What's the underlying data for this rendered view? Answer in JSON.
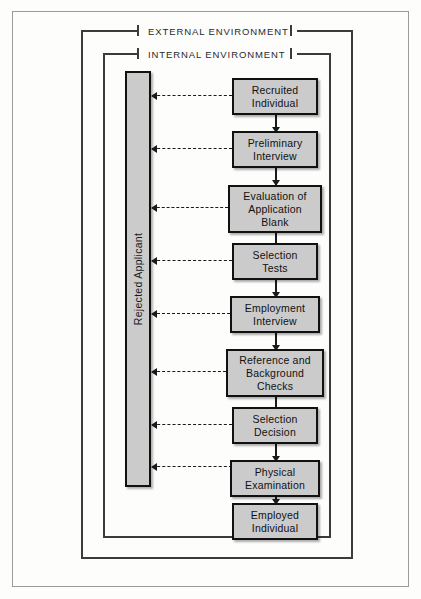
{
  "diagram": {
    "colors": {
      "box_fill": "#cbcbcb",
      "box_border": "#111111",
      "frame_line": "#3b3b3b",
      "page_border": "#9a9a9a",
      "background": "#fdfdfc"
    },
    "environments": [
      {
        "id": "external",
        "label": "EXTERNAL ENVIRONMENT"
      },
      {
        "id": "internal",
        "label": "INTERNAL ENVIRONMENT"
      }
    ],
    "reject_bar": {
      "label": "Rejected Applicant",
      "orientation": "vertical-bottom-to-top"
    },
    "steps": [
      {
        "id": "recruited-individual",
        "lines": [
          "Recruited",
          "Individual"
        ],
        "rejects": true
      },
      {
        "id": "preliminary-interview",
        "lines": [
          "Preliminary",
          "Interview"
        ],
        "rejects": true
      },
      {
        "id": "evaluation-of-application-blank",
        "lines": [
          "Evaluation of",
          "Application",
          "Blank"
        ],
        "rejects": true
      },
      {
        "id": "selection-tests",
        "lines": [
          "Selection",
          "Tests"
        ],
        "rejects": true
      },
      {
        "id": "employment-interview",
        "lines": [
          "Employment",
          "Interview"
        ],
        "rejects": true
      },
      {
        "id": "reference-and-background-checks",
        "lines": [
          "Reference and",
          "Background",
          "Checks"
        ],
        "rejects": true
      },
      {
        "id": "selection-decision",
        "lines": [
          "Selection",
          "Decision"
        ],
        "rejects": true
      },
      {
        "id": "physical-examination",
        "lines": [
          "Physical",
          "Examination"
        ],
        "rejects": true
      },
      {
        "id": "employed-individual",
        "lines": [
          "Employed",
          "Individual"
        ],
        "rejects": false
      }
    ]
  }
}
